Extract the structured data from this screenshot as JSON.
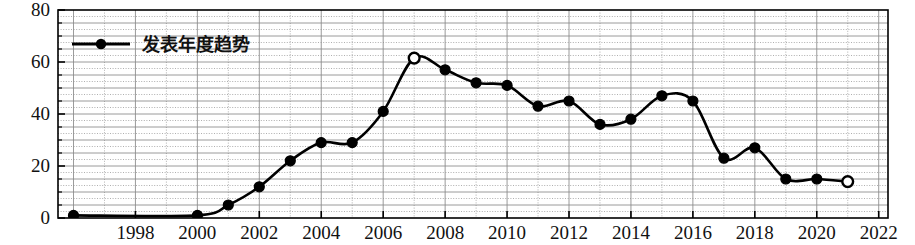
{
  "chart_data": {
    "type": "line",
    "title": "",
    "subtitle": "",
    "xlabel": "",
    "ylabel": "发文量（篇）",
    "legend": [
      "发表年度趋势"
    ],
    "legend_position": "top-left-inside",
    "grid": true,
    "xlim": [
      1995.5,
      2022.3
    ],
    "ylim": [
      0,
      80
    ],
    "yticks": [
      0,
      20,
      40,
      60,
      80
    ],
    "ytick_labels": [
      "0",
      "20",
      "40",
      "60",
      "80"
    ],
    "y_minor_gridline_step": 5,
    "xticks": [
      1998,
      2000,
      2002,
      2004,
      2006,
      2008,
      2010,
      2012,
      2014,
      2016,
      2018,
      2020,
      2022
    ],
    "xtick_labels": [
      "1998",
      "2000",
      "2002",
      "2004",
      "2006",
      "2008",
      "2010",
      "2012",
      "2014",
      "2016",
      "2018",
      "2020",
      "2022"
    ],
    "x": [
      1996,
      2000,
      2001,
      2002,
      2003,
      2004,
      2005,
      2006,
      2007,
      2008,
      2009,
      2010,
      2011,
      2012,
      2013,
      2014,
      2015,
      2016,
      2017,
      2018,
      2019,
      2020,
      2021
    ],
    "values": [
      1,
      1,
      5,
      12,
      22,
      29,
      29,
      41,
      61.5,
      57,
      52,
      51,
      43,
      45,
      36,
      38,
      47,
      45,
      23,
      27,
      15,
      15,
      14
    ],
    "series": [
      {
        "name": "发表年度趋势",
        "values": [
          1,
          1,
          5,
          12,
          22,
          29,
          29,
          41,
          61.5,
          57,
          52,
          51,
          43,
          45,
          36,
          38,
          47,
          45,
          23,
          27,
          15,
          15,
          14
        ]
      }
    ],
    "hollow_marker_indices": [
      8,
      22
    ],
    "line_color": "#000000",
    "marker_color": "#000000",
    "grid_color": "#8a8a8a",
    "axis_color": "#000000",
    "background_color": "#ffffff"
  }
}
